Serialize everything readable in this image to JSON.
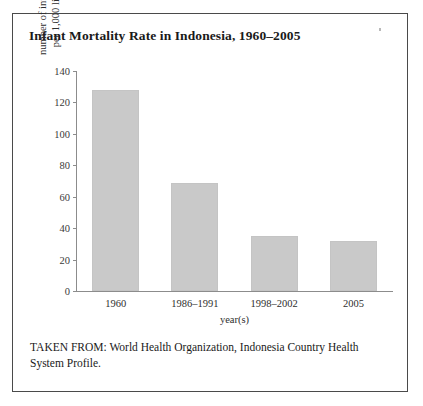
{
  "figure": {
    "title": "Infant Mortality Rate in Indonesia, 1960–2005",
    "source_note": "TAKEN FROM: World Health Organization, Indonesia Country Health System Profile."
  },
  "chart_data": {
    "type": "bar",
    "title": "Infant Mortality Rate in Indonesia, 1960–2005",
    "xlabel": "year(s)",
    "ylabel": "number of infant deaths per 1,000 live births",
    "ylabel_line1": "number of infant deaths",
    "ylabel_line2": "per 1,000 live births",
    "categories": [
      "1960",
      "1986–1991",
      "1998–2002",
      "2005"
    ],
    "values": [
      128,
      69,
      35,
      32
    ],
    "ylim": [
      0,
      140
    ],
    "yticks": [
      "0",
      "20",
      "40",
      "60",
      "80",
      "100",
      "120",
      "140"
    ],
    "ytick_values": [
      0,
      20,
      40,
      60,
      80,
      100,
      120,
      140
    ],
    "grid": false,
    "legend": "none",
    "bar_color": "#c9c9c9",
    "axis_color": "#8c8c8c"
  }
}
